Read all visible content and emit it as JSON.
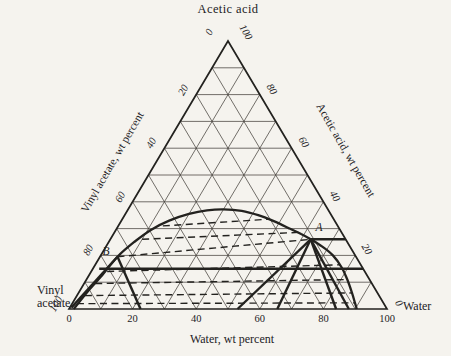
{
  "chart_data": {
    "type": "ternary",
    "components": {
      "top": "Acetic acid",
      "bottom_left": "Vinyl acetate",
      "bottom_right": "Water"
    },
    "corner_labels": {
      "left_line1": "Vinyl",
      "left_line2": "acetate",
      "right": "Water"
    },
    "axes": {
      "left": {
        "title": "Vinyl acetate, wt percent",
        "ticks": [
          0,
          20,
          40,
          60,
          80,
          100
        ]
      },
      "right": {
        "title": "Acetic acid, wt percent",
        "ticks": [
          100,
          80,
          60,
          40,
          20,
          0
        ]
      },
      "bottom": {
        "title": "Water, wt percent",
        "ticks": [
          0,
          20,
          40,
          60,
          80,
          100
        ]
      }
    },
    "grid_interval_percent": 10,
    "axis_range": [
      0,
      100
    ],
    "binodal_curve_w_a": [
      [
        1.5,
        0
      ],
      [
        2.5,
        6
      ],
      [
        4,
        12
      ],
      [
        5.5,
        19.5
      ],
      [
        8,
        25
      ],
      [
        11,
        29.5
      ],
      [
        15,
        33
      ],
      [
        20,
        35.5
      ],
      [
        25,
        36.8
      ],
      [
        30,
        37.2
      ],
      [
        36,
        36.6
      ],
      [
        42,
        35
      ],
      [
        48,
        32.8
      ],
      [
        54,
        30.2
      ],
      [
        59,
        28
      ],
      [
        63,
        26
      ],
      [
        68,
        23.3
      ],
      [
        73,
        20
      ],
      [
        78,
        15.5
      ],
      [
        82,
        11
      ],
      [
        86,
        6
      ],
      [
        89,
        2
      ],
      [
        90.5,
        0
      ]
    ],
    "tie_lines_w_a": [
      [
        [
          14,
          31
        ],
        [
          46,
          33.5
        ]
      ],
      [
        [
          10,
          26
        ],
        [
          58,
          28.6
        ]
      ],
      [
        [
          5.5,
          19.5
        ],
        [
          63,
          26
        ]
      ],
      [
        [
          5,
          14
        ],
        [
          77,
          16.5
        ]
      ],
      [
        [
          3.5,
          9.5
        ],
        [
          82,
          11
        ]
      ],
      [
        [
          2.5,
          5
        ],
        [
          86,
          6
        ]
      ],
      [
        [
          1.5,
          2
        ],
        [
          89,
          2.3
        ]
      ]
    ],
    "construction_lines_w_a": [
      [
        [
          0.5,
          0.5
        ],
        [
          5.5,
          19.5
        ]
      ],
      [
        [
          5.5,
          19.5
        ],
        [
          22.5,
          0
        ]
      ],
      [
        [
          2,
          15
        ],
        [
          85,
          15
        ]
      ],
      [
        [
          63,
          26
        ],
        [
          53,
          0
        ]
      ],
      [
        [
          63,
          26
        ],
        [
          65.5,
          0
        ]
      ],
      [
        [
          63,
          26
        ],
        [
          84,
          0
        ]
      ],
      [
        [
          63,
          26
        ],
        [
          88,
          0
        ]
      ],
      [
        [
          63,
          26
        ],
        [
          74,
          26
        ]
      ]
    ],
    "points": {
      "A": {
        "label": "A",
        "water": 63,
        "acetic_acid": 26,
        "vinyl_acetate": 11
      },
      "B": {
        "label": "B",
        "water": 5.5,
        "acetic_acid": 19.5,
        "vinyl_acetate": 75
      }
    },
    "colors": {
      "paper": "#f5f3ee",
      "ink": "#23221f",
      "grid": "#45423c"
    }
  }
}
